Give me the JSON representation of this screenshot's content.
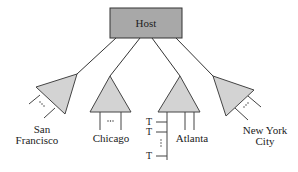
{
  "diagram": {
    "host": {
      "label": "Host",
      "fill": "#a8a8a8",
      "stroke": "#333333"
    },
    "concentrator_fill": "#d3d3d3",
    "nodes": [
      {
        "id": "san-francisco",
        "label_line1": "San",
        "label_line2": "Francisco"
      },
      {
        "id": "chicago",
        "label": "Chicago"
      },
      {
        "id": "atlanta",
        "label": "Atlanta"
      },
      {
        "id": "new-york-city",
        "label_line1": "New York",
        "label_line2": "City"
      }
    ],
    "terminals": {
      "labels": [
        "T",
        "T",
        "T"
      ],
      "ellipsis": "⋮"
    },
    "ellipsis": "⋯"
  }
}
